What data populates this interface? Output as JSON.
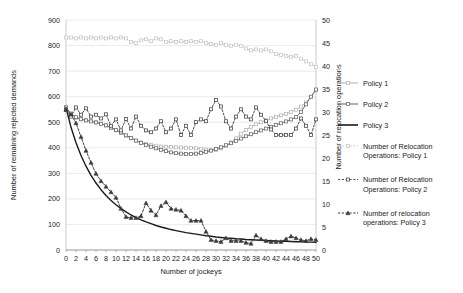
{
  "chart_data": {
    "type": "line",
    "title": "",
    "xlabel": "Number of jockeys",
    "ylabel": "Number of remaining rejected demands",
    "y2label": "Number of relocation operations",
    "xlim": [
      0,
      50
    ],
    "ylim": [
      0,
      900
    ],
    "y2lim": [
      0,
      50
    ],
    "grid": true,
    "legend_position": "right",
    "xticks": [
      0,
      2,
      4,
      6,
      8,
      10,
      12,
      14,
      16,
      18,
      20,
      22,
      24,
      26,
      28,
      30,
      32,
      34,
      36,
      38,
      40,
      42,
      44,
      46,
      48,
      50
    ],
    "yticks": [
      0,
      100,
      200,
      300,
      400,
      500,
      600,
      700,
      800,
      900
    ],
    "y2ticks": [
      0,
      5,
      10,
      15,
      20,
      25,
      30,
      35,
      40,
      45,
      50
    ],
    "x": [
      0,
      1,
      2,
      3,
      4,
      5,
      6,
      7,
      8,
      9,
      10,
      11,
      12,
      13,
      14,
      15,
      16,
      17,
      18,
      19,
      20,
      21,
      22,
      23,
      24,
      25,
      26,
      27,
      28,
      29,
      30,
      31,
      32,
      33,
      34,
      35,
      36,
      37,
      38,
      39,
      40,
      41,
      42,
      43,
      44,
      45,
      46,
      47,
      48,
      49,
      50
    ],
    "series": [
      {
        "name": "Policy 1",
        "axis": "left",
        "color": "#b8b8b8",
        "marker": "square",
        "dashed": false,
        "values": [
          558,
          530,
          516,
          512,
          508,
          505,
          500,
          494,
          487,
          477,
          468,
          458,
          447,
          437,
          428,
          421,
          415,
          411,
          408,
          405,
          404,
          403,
          402,
          401,
          400,
          399,
          398,
          396,
          393,
          390,
          392,
          398,
          408,
          421,
          437,
          455,
          470,
          482,
          492,
          500,
          508,
          515,
          521,
          527,
          533,
          540,
          549,
          561,
          577,
          598,
          625
        ]
      },
      {
        "name": "Policy 2",
        "axis": "left",
        "color": "#6d6d6d",
        "marker": "square",
        "dashed": false,
        "values": [
          558,
          534,
          520,
          512,
          507,
          503,
          499,
          494,
          488,
          479,
          470,
          460,
          449,
          438,
          428,
          419,
          411,
          404,
          398,
          392,
          387,
          382,
          379,
          377,
          376,
          376,
          377,
          380,
          384,
          389,
          395,
          402,
          410,
          418,
          427,
          436,
          445,
          453,
          461,
          468,
          475,
          482,
          489,
          496,
          503,
          511,
          520,
          540,
          570,
          600,
          628
        ]
      },
      {
        "name": "Policy 3",
        "axis": "left",
        "color": "#1a1a1a",
        "marker": "none",
        "dashed": false,
        "values": [
          558,
          480,
          420,
          370,
          328,
          292,
          262,
          236,
          213,
          194,
          177,
          162,
          149,
          137,
          127,
          118,
          110,
          103,
          96,
          90,
          85,
          80,
          76,
          72,
          68,
          65,
          62,
          59,
          56,
          54,
          51,
          49,
          47,
          46,
          44,
          43,
          41,
          40,
          39,
          38,
          37,
          36,
          35,
          34,
          34,
          33,
          32,
          32,
          31,
          31,
          30
        ]
      },
      {
        "name": "Number of Relocation Operations: Policy 1",
        "axis": "right",
        "color": "#c9c9c9",
        "marker": "square",
        "dashed": true,
        "values": [
          46.2,
          46.2,
          46.0,
          46.2,
          46.0,
          46.2,
          46.0,
          46.2,
          46.0,
          46.2,
          46.0,
          46.2,
          46.0,
          45.2,
          45.0,
          45.6,
          45.8,
          45.4,
          46.0,
          45.8,
          45.2,
          45.4,
          45.2,
          45.4,
          45.2,
          45.4,
          45.2,
          45.4,
          45.0,
          44.8,
          44.6,
          45.0,
          44.6,
          44.4,
          44.6,
          44.4,
          43.8,
          43.4,
          43.6,
          43.4,
          43.6,
          43.2,
          42.6,
          42.4,
          42.2,
          42.0,
          42.2,
          41.6,
          41.0,
          40.4,
          39.8
        ]
      },
      {
        "name": "Number of Relocation Operations: Policy 2",
        "axis": "right",
        "color": "#4d4d4d",
        "marker": "square",
        "dashed": true,
        "values": [
          30.5,
          29.0,
          31.0,
          29.4,
          30.8,
          29.0,
          29.4,
          28.6,
          29.5,
          27.0,
          28.4,
          26.0,
          28.5,
          26.4,
          29.0,
          27.0,
          26.0,
          25.6,
          26.4,
          28.0,
          25.6,
          26.4,
          28.4,
          25.0,
          27.0,
          25.0,
          27.8,
          28.4,
          28.0,
          30.6,
          32.6,
          31.2,
          28.0,
          26.4,
          29.0,
          30.6,
          29.0,
          28.4,
          31.0,
          29.4,
          28.0,
          26.2,
          25.0,
          25.0,
          25.0,
          25.0,
          26.4,
          28.6,
          27.0,
          25.0,
          28.4
        ]
      },
      {
        "name": "Number of relocation operations: Policy 3",
        "axis": "right",
        "color": "#3a3a3a",
        "marker": "triangle",
        "dashed": true,
        "values": [
          30.5,
          29.5,
          27.6,
          24.6,
          21.6,
          19.0,
          16.6,
          15.0,
          13.8,
          12.6,
          11.4,
          9.0,
          7.2,
          7.0,
          7.0,
          7.4,
          10.2,
          8.6,
          7.6,
          9.6,
          10.4,
          9.0,
          8.8,
          8.6,
          7.4,
          6.4,
          6.4,
          6.4,
          4.0,
          2.2,
          2.0,
          1.8,
          2.6,
          2.0,
          2.0,
          2.0,
          1.6,
          1.4,
          3.2,
          2.4,
          2.0,
          1.8,
          1.8,
          1.8,
          2.4,
          3.0,
          2.6,
          2.2,
          2.0,
          2.4,
          2.2
        ]
      }
    ],
    "legend": [
      {
        "label": "Policy 1",
        "color": "#b8b8b8",
        "marker": "square",
        "dashed": false
      },
      {
        "label": "Policy 2",
        "color": "#6d6d6d",
        "marker": "square",
        "dashed": false
      },
      {
        "label": "Policy 3",
        "color": "#1a1a1a",
        "marker": "none",
        "dashed": false
      },
      {
        "label": "Number of Relocation",
        "label2": "Operations: Policy 1",
        "color": "#c9c9c9",
        "marker": "square",
        "dashed": true
      },
      {
        "label": "Number of Relocation",
        "label2": "Operations: Policy 2",
        "color": "#4d4d4d",
        "marker": "square",
        "dashed": true
      },
      {
        "label": "Number of relocation",
        "label2": "operations: Policy 3",
        "color": "#3a3a3a",
        "marker": "triangle",
        "dashed": true
      }
    ]
  }
}
